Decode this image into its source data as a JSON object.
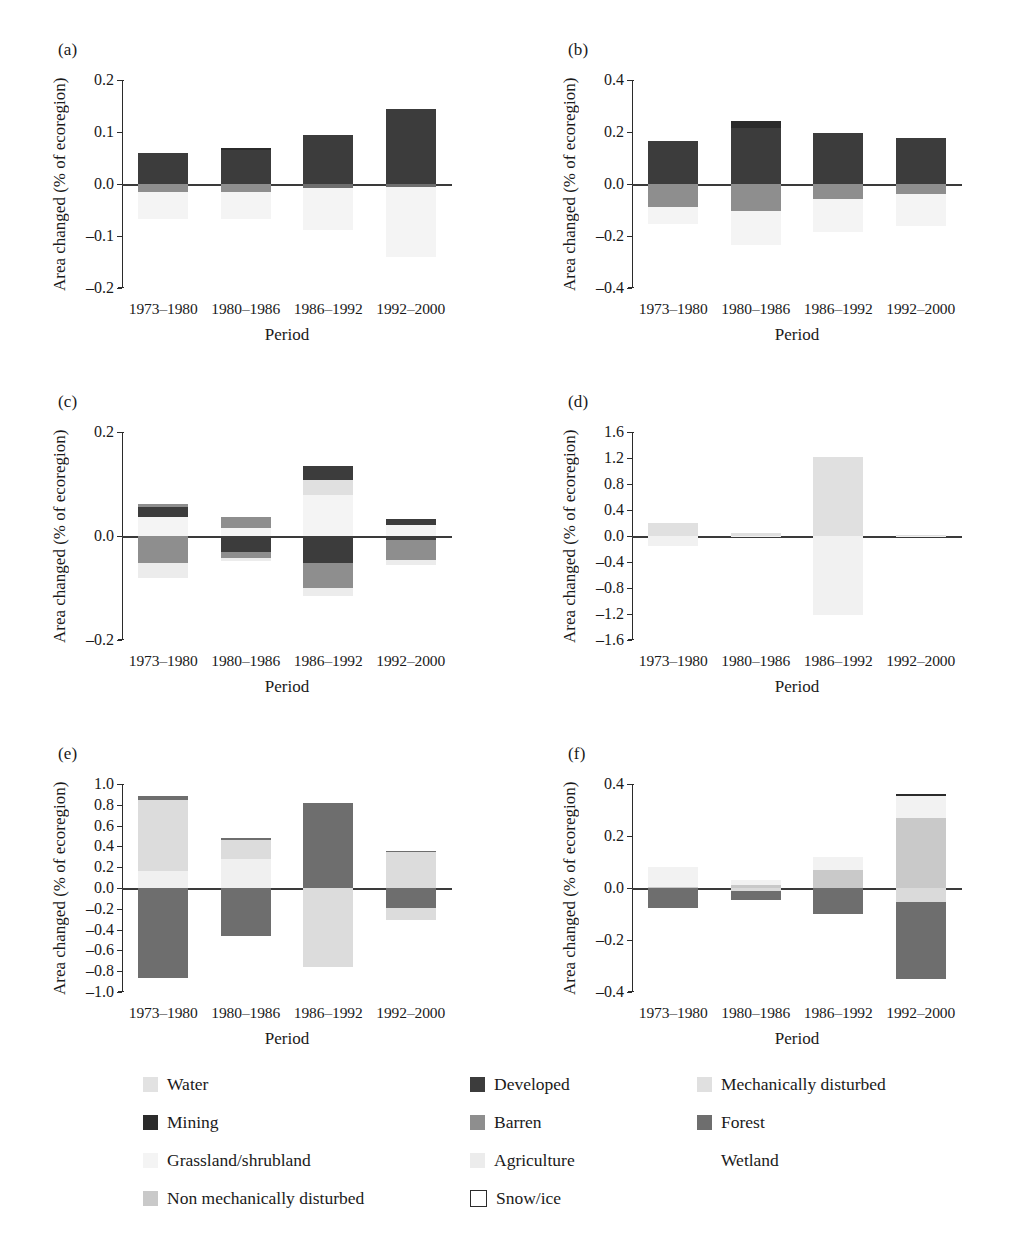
{
  "axis": {
    "ylabel": "Area changed (% of ecoregion)",
    "xlabel": "Period",
    "categories": [
      "1973–1980",
      "1980–1986",
      "1986–1992",
      "1992–2000"
    ]
  },
  "panels": [
    {
      "tag": "(a)",
      "ylim": [
        -0.2,
        0.2
      ],
      "yticks": [
        "0.2",
        "0.1",
        "0.0",
        "-0.1",
        "-0.2"
      ]
    },
    {
      "tag": "(b)",
      "ylim": [
        -0.4,
        0.4
      ],
      "yticks": [
        "0.4",
        "0.2",
        "0.0",
        "-0.2",
        "-0.4"
      ]
    },
    {
      "tag": "(c)",
      "ylim": [
        -0.2,
        0.2
      ],
      "yticks": [
        "0.2",
        "0.0",
        "-0.2"
      ]
    },
    {
      "tag": "(d)",
      "ylim": [
        -1.6,
        1.6
      ],
      "yticks": [
        "1.6",
        "1.2",
        "0.8",
        "0.4",
        "0.0",
        "-0.4",
        "-0.8",
        "-1.2",
        "-1.6"
      ]
    },
    {
      "tag": "(e)",
      "ylim": [
        -1.0,
        1.0
      ],
      "yticks": [
        "1.0",
        "0.8",
        "0.6",
        "0.4",
        "0.2",
        "0.0",
        "-0.2",
        "-0.4",
        "-0.6",
        "-0.8",
        "-1.0"
      ]
    },
    {
      "tag": "(f)",
      "ylim": [
        -0.4,
        0.4
      ],
      "yticks": [
        "0.4",
        "0.2",
        "0.0",
        "-0.2",
        "-0.4"
      ]
    }
  ],
  "legend": {
    "columns": [
      [
        {
          "label": "Water",
          "color": "#e2e2e2",
          "style": "fill"
        },
        {
          "label": "Mining",
          "color": "#2b2b2b",
          "style": "fill"
        },
        {
          "label": "Grassland/shrubland",
          "color": "#f4f4f4",
          "style": "fill"
        },
        {
          "label": "Non mechanically disturbed",
          "color": "#c9c9c9",
          "style": "fill"
        }
      ],
      [
        {
          "label": "Developed",
          "color": "#3c3c3c",
          "style": "fill"
        },
        {
          "label": "Barren",
          "color": "#8e8e8e",
          "style": "fill"
        },
        {
          "label": "Agriculture",
          "color": "#ececec",
          "style": "fill"
        },
        {
          "label": "Snow/ice",
          "color": "#ffffff",
          "style": "outline"
        }
      ],
      [
        {
          "label": "Mechanically disturbed",
          "color": "#e0e0e0",
          "style": "fill"
        },
        {
          "label": "Forest",
          "color": "#6e6e6e",
          "style": "fill"
        },
        {
          "label": "Wetland",
          "color": "#ffffff",
          "style": "blank"
        }
      ]
    ]
  },
  "colors": {
    "water": "#e2e2e2",
    "developed": "#3c3c3c",
    "mech_disturbed": "#e0e0e0",
    "mining": "#2b2b2b",
    "barren": "#8e8e8e",
    "forest": "#6e6e6e",
    "grassland": "#f4f4f4",
    "agriculture": "#ececec",
    "wetland": "#ffffff",
    "non_mech_disturbed": "#c9c9c9",
    "snow_ice": "#ffffff"
  },
  "chart_data": [
    {
      "type": "bar",
      "panel": "(a)",
      "title": "(a)",
      "xlabel": "Period",
      "ylabel": "Area changed (% of ecoregion)",
      "categories": [
        "1973–1980",
        "1980–1986",
        "1986–1992",
        "1992–2000"
      ],
      "ylim": [
        -0.2,
        0.2
      ],
      "stacked": true,
      "grid": false,
      "legend_position": "bottom",
      "series": [
        {
          "name": "Developed",
          "color": "#3c3c3c",
          "values": [
            0.06,
            0.065,
            0.095,
            0.144
          ]
        },
        {
          "name": "Mining",
          "color": "#2b2b2b",
          "values": [
            0.0,
            0.005,
            0.0,
            0.0
          ]
        },
        {
          "name": "Barren",
          "color": "#8e8e8e",
          "values": [
            -0.015,
            -0.016,
            0.0,
            0.0
          ]
        },
        {
          "name": "Forest",
          "color": "#6e6e6e",
          "values": [
            0.0,
            0.0,
            -0.007,
            -0.006
          ]
        },
        {
          "name": "Grassland/shrubland",
          "color": "#f4f4f4",
          "values": [
            -0.052,
            -0.052,
            -0.082,
            -0.135
          ]
        }
      ]
    },
    {
      "type": "bar",
      "panel": "(b)",
      "title": "(b)",
      "xlabel": "Period",
      "ylabel": "Area changed (% of ecoregion)",
      "categories": [
        "1973–1980",
        "1980–1986",
        "1986–1992",
        "1992–2000"
      ],
      "ylim": [
        -0.4,
        0.4
      ],
      "stacked": true,
      "grid": false,
      "legend_position": "bottom",
      "series": [
        {
          "name": "Developed",
          "color": "#3c3c3c",
          "values": [
            0.166,
            0.215,
            0.197,
            0.176
          ]
        },
        {
          "name": "Mining",
          "color": "#2b2b2b",
          "values": [
            0.0,
            0.027,
            0.0,
            0.0
          ]
        },
        {
          "name": "Barren",
          "color": "#8e8e8e",
          "values": [
            -0.09,
            -0.103,
            -0.058,
            -0.04
          ]
        },
        {
          "name": "Grassland/shrubland",
          "color": "#f4f4f4",
          "values": [
            -0.065,
            -0.133,
            -0.128,
            -0.12
          ]
        }
      ]
    },
    {
      "type": "bar",
      "panel": "(c)",
      "title": "(c)",
      "xlabel": "Period",
      "ylabel": "Area changed (% of ecoregion)",
      "categories": [
        "1973–1980",
        "1980–1986",
        "1986–1992",
        "1992–2000"
      ],
      "ylim": [
        -0.2,
        0.2
      ],
      "stacked": true,
      "grid": false,
      "legend_position": "bottom",
      "series": [
        {
          "name": "Grassland/shrubland",
          "color": "#f4f4f4",
          "values": [
            0.036,
            0.016,
            0.078,
            0.022
          ]
        },
        {
          "name": "Mechanically disturbed",
          "color": "#e0e0e0",
          "values": [
            0.0,
            0.0,
            0.03,
            0.0
          ]
        },
        {
          "name": "Developed",
          "color": "#3c3c3c",
          "values": [
            0.02,
            0.0,
            0.027,
            0.01
          ]
        },
        {
          "name": "Barren",
          "color": "#8e8e8e",
          "values": [
            0.006,
            0.02,
            0.0,
            0.0
          ]
        },
        {
          "name": "Forest-neg",
          "color": "#3c3c3c",
          "values": [
            0.0,
            -0.03,
            -0.052,
            -0.008
          ]
        },
        {
          "name": "Barren-neg",
          "color": "#8e8e8e",
          "values": [
            -0.052,
            -0.012,
            -0.048,
            -0.038
          ]
        },
        {
          "name": "Agriculture",
          "color": "#ececec",
          "values": [
            -0.028,
            -0.006,
            -0.016,
            -0.01
          ]
        }
      ]
    },
    {
      "type": "bar",
      "panel": "(d)",
      "title": "(d)",
      "xlabel": "Period",
      "ylabel": "Area changed (% of ecoregion)",
      "categories": [
        "1973–1980",
        "1980–1986",
        "1986–1992",
        "1992–2000"
      ],
      "ylim": [
        -1.6,
        1.6
      ],
      "stacked": true,
      "grid": false,
      "legend_position": "bottom",
      "series": [
        {
          "name": "Mechanically disturbed",
          "color": "#e0e0e0",
          "values": [
            0.2,
            0.04,
            1.22,
            0.01
          ]
        },
        {
          "name": "Grassland/shrubland",
          "color": "#f1f1f1",
          "values": [
            -0.16,
            -0.01,
            -1.21,
            -0.01
          ]
        }
      ]
    },
    {
      "type": "bar",
      "panel": "(e)",
      "title": "(e)",
      "xlabel": "Period",
      "ylabel": "Area changed (% of ecoregion)",
      "categories": [
        "1973–1980",
        "1980–1986",
        "1986–1992",
        "1992–2000"
      ],
      "ylim": [
        -1.0,
        1.0
      ],
      "stacked": true,
      "grid": false,
      "legend_position": "bottom",
      "series": [
        {
          "name": "Mechanically disturbed",
          "color": "#f0f0f0",
          "values": [
            0.16,
            0.28,
            0.0,
            0.0
          ]
        },
        {
          "name": "Grassland/shrubland",
          "color": "#dcdcdc",
          "values": [
            0.69,
            0.18,
            0.0,
            0.35
          ]
        },
        {
          "name": "Forest",
          "color": "#6e6e6e",
          "values": [
            0.03,
            0.02,
            0.82,
            0.01
          ]
        },
        {
          "name": "Forest-neg",
          "color": "#6e6e6e",
          "values": [
            -0.87,
            -0.46,
            0.0,
            -0.19
          ]
        },
        {
          "name": "Mech-disturbed-neg",
          "color": "#dcdcdc",
          "values": [
            0.0,
            0.0,
            -0.76,
            -0.12
          ]
        }
      ]
    },
    {
      "type": "bar",
      "panel": "(f)",
      "title": "(f)",
      "xlabel": "Period",
      "ylabel": "Area changed (% of ecoregion)",
      "categories": [
        "1973–1980",
        "1980–1986",
        "1986–1992",
        "1992–2000"
      ],
      "ylim": [
        -0.4,
        0.4
      ],
      "stacked": true,
      "grid": false,
      "legend_position": "bottom",
      "series": [
        {
          "name": "Non mechanically disturbed",
          "color": "#c9c9c9",
          "values": [
            0.005,
            0.01,
            0.07,
            0.27
          ]
        },
        {
          "name": "Grassland/shrubland",
          "color": "#f2f2f2",
          "values": [
            0.075,
            0.022,
            0.05,
            0.082
          ]
        },
        {
          "name": "Mining",
          "color": "#2b2b2b",
          "values": [
            0.0,
            0.0,
            0.0,
            0.008
          ]
        },
        {
          "name": "Mech-disturbed-neg",
          "color": "#dadada",
          "values": [
            0.0,
            -0.012,
            0.0,
            -0.055
          ]
        },
        {
          "name": "Forest",
          "color": "#6e6e6e",
          "values": [
            -0.078,
            -0.034,
            -0.1,
            -0.295
          ]
        }
      ]
    }
  ]
}
